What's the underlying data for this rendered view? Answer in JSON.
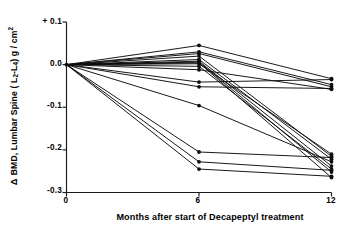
{
  "chart_data": {
    "type": "line",
    "title": "",
    "subtitle": "",
    "xlabel": "Months after start of Decapeptyl treatment",
    "ylabel": "Δ BMD, Lumbar Spine ( L 2 - L 4 ) g / cm 2",
    "ylabel_parts": {
      "delta": "Δ",
      "main_a": "BMD, Lumbar Spine ( L",
      "sub_a": "2",
      "dash": "-",
      "main_b": "L",
      "sub_b": "4",
      "main_c": ") g / cm",
      "sup": "2"
    },
    "x": [
      0,
      6,
      12
    ],
    "xticklabels": [
      "0",
      "6",
      "12"
    ],
    "yticklabels": [
      "+ 0.1",
      "0.0",
      "-0.1",
      "-0.2",
      "-0.3"
    ],
    "yticks": [
      0.1,
      0.0,
      -0.1,
      -0.2,
      -0.3
    ],
    "xlim": [
      0,
      12
    ],
    "ylim": [
      -0.3,
      0.1
    ],
    "grid": false,
    "legend": false,
    "legend_position": "none",
    "marker": "filled-circle",
    "n_series": 16,
    "series": [
      {
        "name": "subject-1",
        "values": [
          0.0,
          0.045,
          -0.033
        ]
      },
      {
        "name": "subject-2",
        "values": [
          0.0,
          0.03,
          -0.047
        ]
      },
      {
        "name": "subject-3",
        "values": [
          0.0,
          0.026,
          -0.052
        ]
      },
      {
        "name": "subject-4",
        "values": [
          0.0,
          0.02,
          -0.215
        ]
      },
      {
        "name": "subject-5",
        "values": [
          0.0,
          0.012,
          -0.222
        ]
      },
      {
        "name": "subject-6",
        "values": [
          0.0,
          0.008,
          -0.238
        ]
      },
      {
        "name": "subject-7",
        "values": [
          0.0,
          0.006,
          -0.252
        ]
      },
      {
        "name": "subject-8",
        "values": [
          0.0,
          0.004,
          -0.265
        ]
      },
      {
        "name": "subject-9",
        "values": [
          0.0,
          0.002,
          -0.21
        ]
      },
      {
        "name": "subject-10",
        "values": [
          0.0,
          -0.004,
          -0.245
        ]
      },
      {
        "name": "subject-11",
        "values": [
          0.0,
          -0.012,
          -0.058
        ]
      },
      {
        "name": "subject-12",
        "values": [
          0.0,
          -0.041,
          -0.035
        ]
      },
      {
        "name": "subject-13",
        "values": [
          0.0,
          -0.052,
          -0.056
        ]
      },
      {
        "name": "subject-14",
        "values": [
          0.0,
          -0.096,
          -0.228
        ]
      },
      {
        "name": "subject-15",
        "values": [
          0.0,
          -0.205,
          -0.218
        ]
      },
      {
        "name": "subject-16",
        "values": [
          0.0,
          -0.228,
          -0.248
        ]
      },
      {
        "name": "subject-17",
        "values": [
          0.0,
          -0.245,
          -0.262
        ]
      }
    ],
    "colors": {
      "line": "#0d0d0d",
      "marker": "#0d0d0d",
      "axis": "#1a1a1a",
      "background": "#ffffff"
    }
  }
}
